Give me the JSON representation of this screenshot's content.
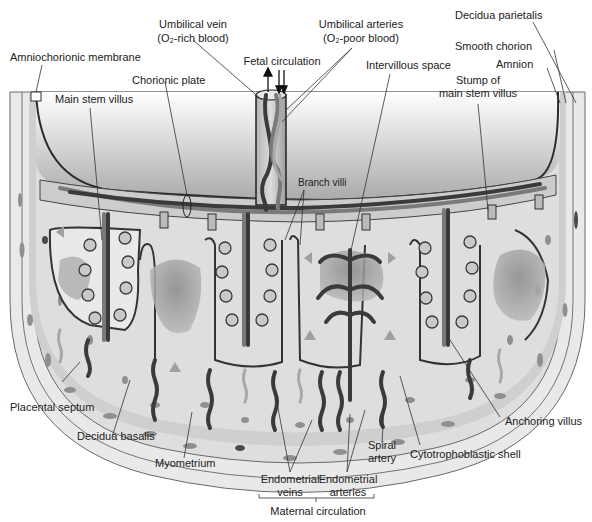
{
  "figure": {
    "labels": {
      "amniochorionic_membrane": "Amniochorionic membrane",
      "umbilical_vein_1": "Umbilical vein",
      "umbilical_vein_2": "(O₂-rich blood)",
      "umbilical_arteries_1": "Umbilical arteries",
      "umbilical_arteries_2": "(O₂-poor blood)",
      "decidua_parietalis": "Decidua parietalis",
      "smooth_chorion": "Smooth chorion",
      "amnion": "Amnion",
      "fetal_circulation": "Fetal circulation",
      "chorionic_plate": "Chorionic plate",
      "intervillous_space": "Intervillous space",
      "stump_1": "Stump of",
      "stump_2": "main stem villus",
      "main_stem_villus": "Main stem villus",
      "branch_villi": "Branch villi",
      "placental_septum": "Placental septum",
      "decidua_basalis": "Decidua basalis",
      "myometrium": "Myometrium",
      "anchoring_villus": "Anchoring villus",
      "spiral_artery_1": "Spiral",
      "spiral_artery_2": "artery",
      "cytotrophoblastic_shell": "Cytotrophoblastic shell",
      "endometrial_veins_1": "Endometrial",
      "endometrial_veins_2": "veins",
      "endometrial_arteries_1": "Endometrial",
      "endometrial_arteries_2": "arteries",
      "maternal_circulation": "Maternal circulation"
    },
    "colors": {
      "background": "#ffffff",
      "tissue_light": "#e6e6e6",
      "tissue_mid": "#c8c8c8",
      "amniotic_top": "#ffffff",
      "amniotic_bottom": "#a9a9a9",
      "vessel_dark": "#3a3a3a",
      "vessel_mid": "#7a7a7a",
      "outline": "#2a2a2a"
    }
  }
}
